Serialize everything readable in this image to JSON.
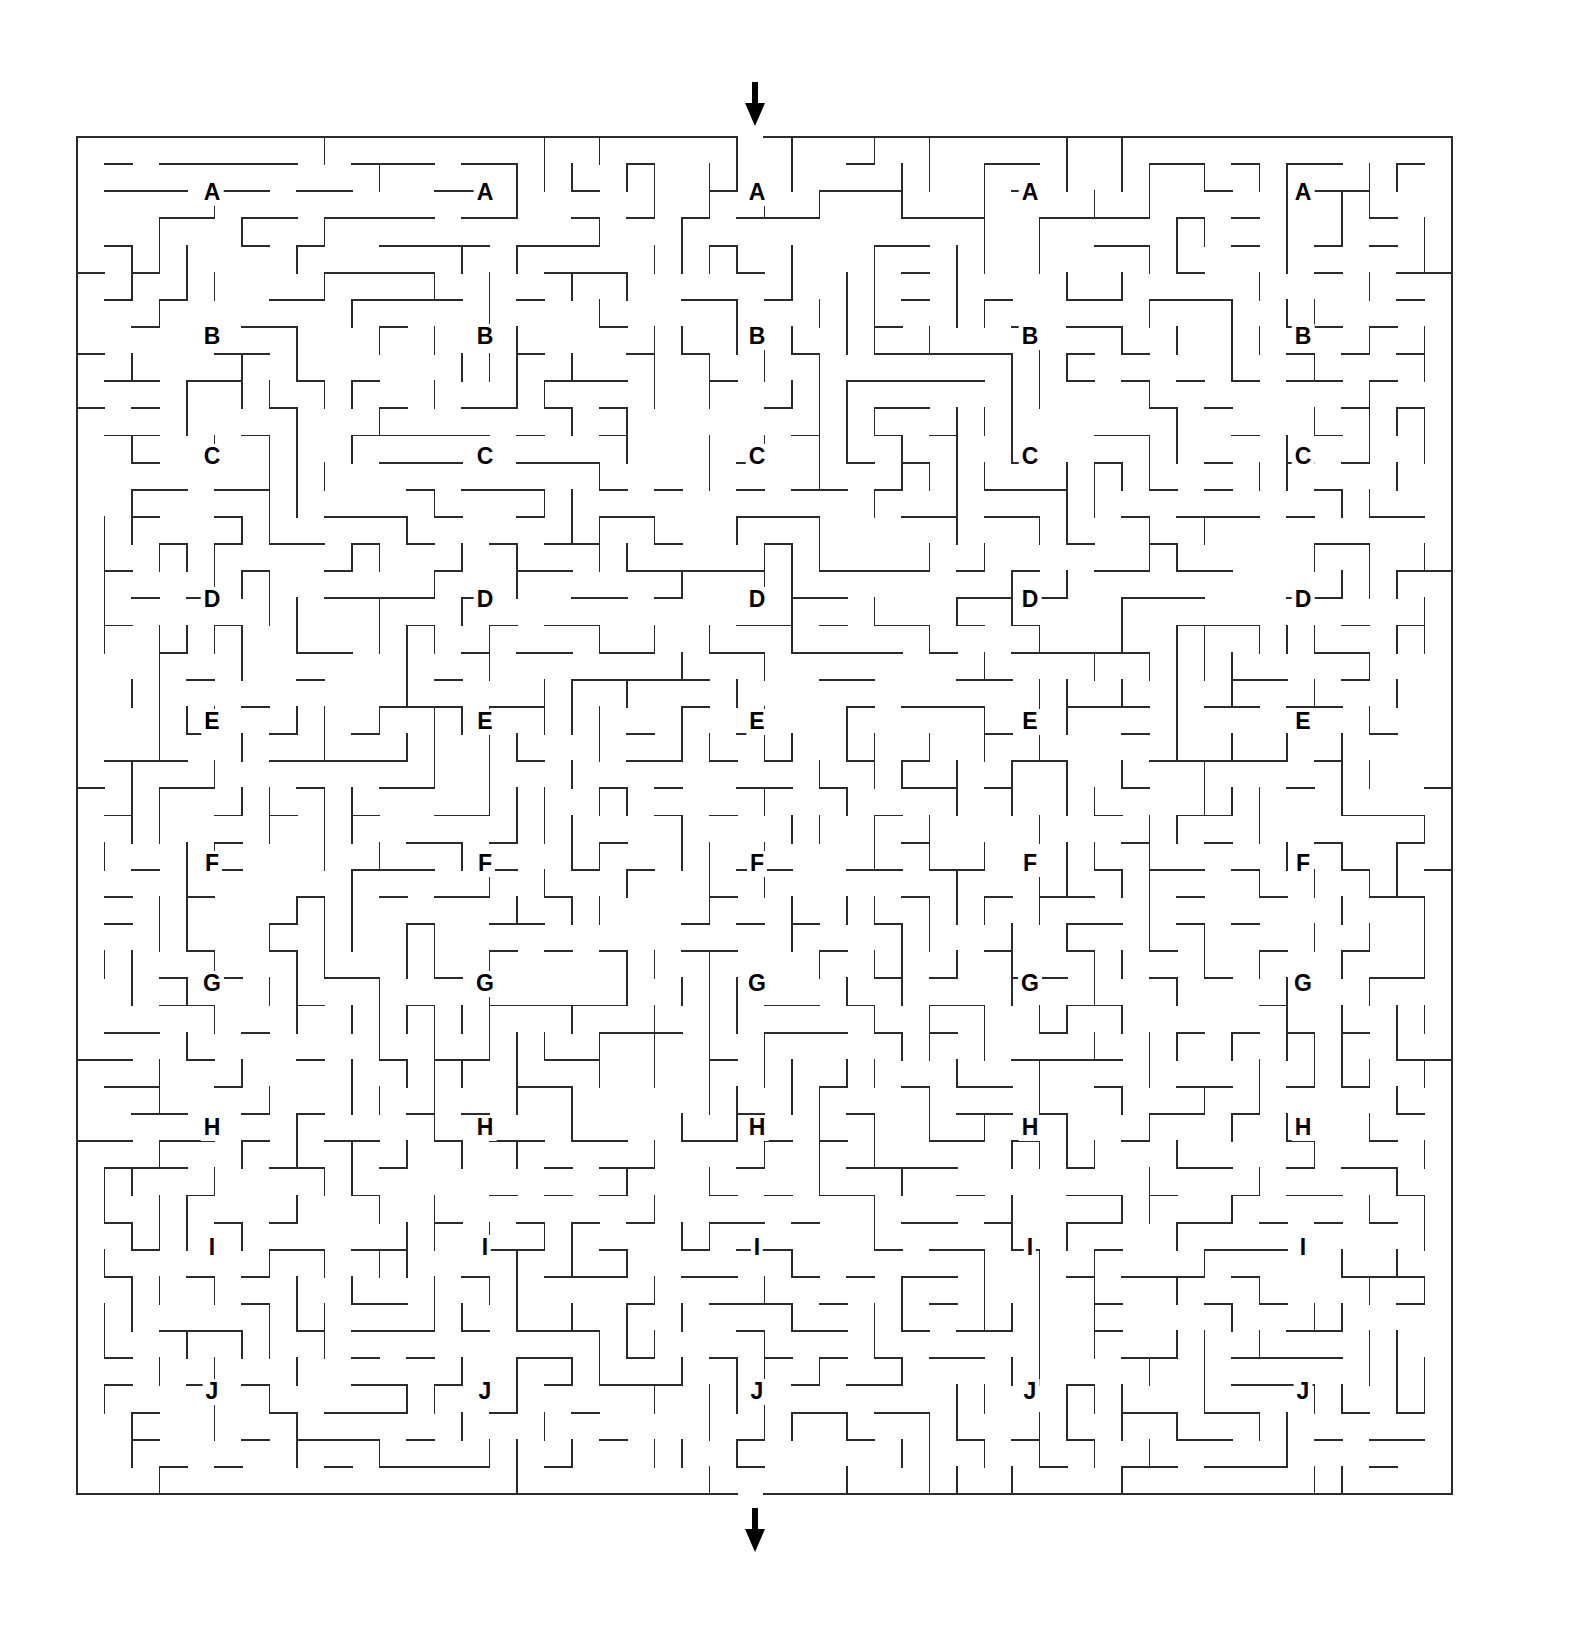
{
  "figure": {
    "kind": "maze-puzzle",
    "background_color": "#ffffff",
    "wall_color": "#2b2b2b",
    "label_color": "#000000",
    "canvas": {
      "width": 1575,
      "height": 1633
    }
  },
  "maze": {
    "grid": {
      "cols": 50,
      "rows": 50
    },
    "bounds": {
      "left": 77,
      "top": 137,
      "right": 1452,
      "bottom": 1494
    },
    "cell_width": 27.5,
    "cell_height": 27.14,
    "entrance": {
      "label": "top-entrance",
      "x": 755,
      "y": 137,
      "direction": "down"
    },
    "exit": {
      "label": "bottom-exit",
      "x": 755,
      "y": 1494,
      "direction": "down"
    }
  },
  "arrows": [
    {
      "name": "entrance-arrow",
      "glyph": "↓",
      "x": 755,
      "y": 82,
      "length": 44
    },
    {
      "name": "exit-arrow",
      "glyph": "↓",
      "x": 755,
      "y": 1508,
      "length": 44
    }
  ],
  "label_columns_x": [
    212,
    485,
    757,
    1030,
    1303
  ],
  "label_rows": [
    {
      "letter": "A",
      "y": 193
    },
    {
      "letter": "B",
      "y": 337
    },
    {
      "letter": "C",
      "y": 457
    },
    {
      "letter": "D",
      "y": 600
    },
    {
      "letter": "E",
      "y": 722
    },
    {
      "letter": "F",
      "y": 864
    },
    {
      "letter": "G",
      "y": 984
    },
    {
      "letter": "H",
      "y": 1128
    },
    {
      "letter": "I",
      "y": 1248
    },
    {
      "letter": "J",
      "y": 1392
    }
  ],
  "labels": [
    {
      "letter": "A",
      "x": 212,
      "y": 193
    },
    {
      "letter": "A",
      "x": 485,
      "y": 193
    },
    {
      "letter": "A",
      "x": 757,
      "y": 193
    },
    {
      "letter": "A",
      "x": 1030,
      "y": 193
    },
    {
      "letter": "A",
      "x": 1303,
      "y": 193
    },
    {
      "letter": "B",
      "x": 212,
      "y": 337
    },
    {
      "letter": "B",
      "x": 485,
      "y": 337
    },
    {
      "letter": "B",
      "x": 757,
      "y": 337
    },
    {
      "letter": "B",
      "x": 1030,
      "y": 337
    },
    {
      "letter": "B",
      "x": 1303,
      "y": 337
    },
    {
      "letter": "C",
      "x": 212,
      "y": 457
    },
    {
      "letter": "C",
      "x": 485,
      "y": 457
    },
    {
      "letter": "C",
      "x": 757,
      "y": 457
    },
    {
      "letter": "C",
      "x": 1030,
      "y": 457
    },
    {
      "letter": "C",
      "x": 1303,
      "y": 457
    },
    {
      "letter": "D",
      "x": 212,
      "y": 600
    },
    {
      "letter": "D",
      "x": 485,
      "y": 600
    },
    {
      "letter": "D",
      "x": 757,
      "y": 600
    },
    {
      "letter": "D",
      "x": 1030,
      "y": 600
    },
    {
      "letter": "D",
      "x": 1303,
      "y": 600
    },
    {
      "letter": "E",
      "x": 212,
      "y": 722
    },
    {
      "letter": "E",
      "x": 485,
      "y": 722
    },
    {
      "letter": "E",
      "x": 757,
      "y": 722
    },
    {
      "letter": "E",
      "x": 1030,
      "y": 722
    },
    {
      "letter": "E",
      "x": 1303,
      "y": 722
    },
    {
      "letter": "F",
      "x": 212,
      "y": 864
    },
    {
      "letter": "F",
      "x": 485,
      "y": 864
    },
    {
      "letter": "F",
      "x": 757,
      "y": 864
    },
    {
      "letter": "F",
      "x": 1030,
      "y": 864
    },
    {
      "letter": "F",
      "x": 1303,
      "y": 864
    },
    {
      "letter": "G",
      "x": 212,
      "y": 984
    },
    {
      "letter": "G",
      "x": 485,
      "y": 984
    },
    {
      "letter": "G",
      "x": 757,
      "y": 984
    },
    {
      "letter": "G",
      "x": 1030,
      "y": 984
    },
    {
      "letter": "G",
      "x": 1303,
      "y": 984
    },
    {
      "letter": "H",
      "x": 212,
      "y": 1128
    },
    {
      "letter": "H",
      "x": 485,
      "y": 1128
    },
    {
      "letter": "H",
      "x": 757,
      "y": 1128
    },
    {
      "letter": "H",
      "x": 1030,
      "y": 1128
    },
    {
      "letter": "H",
      "x": 1303,
      "y": 1128
    },
    {
      "letter": "I",
      "x": 212,
      "y": 1248
    },
    {
      "letter": "I",
      "x": 485,
      "y": 1248
    },
    {
      "letter": "I",
      "x": 757,
      "y": 1248
    },
    {
      "letter": "I",
      "x": 1030,
      "y": 1248
    },
    {
      "letter": "I",
      "x": 1303,
      "y": 1248
    },
    {
      "letter": "J",
      "x": 212,
      "y": 1392
    },
    {
      "letter": "J",
      "x": 485,
      "y": 1392
    },
    {
      "letter": "J",
      "x": 757,
      "y": 1392
    },
    {
      "letter": "J",
      "x": 1030,
      "y": 1392
    },
    {
      "letter": "J",
      "x": 1303,
      "y": 1392
    }
  ],
  "generation": {
    "algorithm": "seeded-randomized-dfs",
    "seed": 20240517,
    "braid_probability": 0.28
  }
}
